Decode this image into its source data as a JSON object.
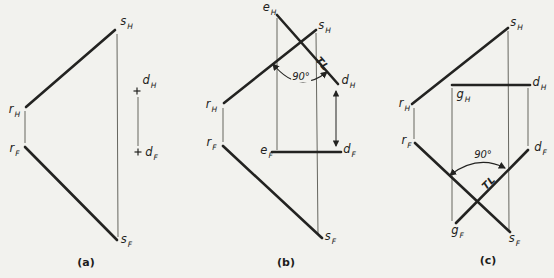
{
  "colors": {
    "paper": "#f2f2ee",
    "ink": "#232321",
    "thin": "#66665f"
  },
  "figures": {
    "a": {
      "caption": "(a)",
      "labels": {
        "sH": {
          "letter": "s",
          "sub": "H"
        },
        "rH": {
          "letter": "r",
          "sub": "H"
        },
        "rF": {
          "letter": "r",
          "sub": "F"
        },
        "sF": {
          "letter": "s",
          "sub": "F"
        },
        "dH": {
          "letter": "d",
          "sub": "H"
        },
        "dF": {
          "letter": "d",
          "sub": "F"
        }
      },
      "geometry": {
        "thick": [
          [
            26,
            107,
            115,
            30
          ],
          [
            25,
            147,
            117,
            240
          ]
        ],
        "thin": [
          [
            117,
            34,
            118,
            237
          ],
          [
            25,
            111,
            25,
            143
          ],
          [
            138,
            97,
            138,
            146
          ]
        ],
        "crosses": [
          [
            137,
            91
          ],
          [
            138,
            152
          ]
        ]
      }
    },
    "b": {
      "caption": "(b)",
      "angle": "90°",
      "tl": "TL",
      "labels": {
        "eH": {
          "letter": "e",
          "sub": "H"
        },
        "sH": {
          "letter": "s",
          "sub": "H"
        },
        "rH": {
          "letter": "r",
          "sub": "H"
        },
        "rF": {
          "letter": "r",
          "sub": "F"
        },
        "eF": {
          "letter": "e",
          "sub": "F"
        },
        "dH": {
          "letter": "d",
          "sub": "H"
        },
        "dF": {
          "letter": "d",
          "sub": "F"
        },
        "sF": {
          "letter": "s",
          "sub": "F"
        }
      },
      "geometry": {
        "thick": [
          [
            224,
            103,
            316,
            30
          ],
          [
            277,
            15,
            338,
            84
          ],
          [
            223,
            146,
            322,
            238
          ],
          [
            272,
            152,
            341,
            152
          ]
        ],
        "thin": [
          [
            277,
            18,
            277,
            150
          ],
          [
            316,
            33,
            318,
            235
          ],
          [
            223,
            108,
            223,
            142
          ]
        ],
        "doubleArrows": [
          [
            336,
            91,
            336,
            146
          ]
        ],
        "arcs": [
          {
            "d": "M273,64 Q298,95 327,72"
          }
        ]
      }
    },
    "c": {
      "caption": "(c)",
      "angle": "90°",
      "tl": "TL",
      "labels": {
        "sH": {
          "letter": "s",
          "sub": "H"
        },
        "rH": {
          "letter": "r",
          "sub": "H"
        },
        "rF": {
          "letter": "r",
          "sub": "F"
        },
        "gH": {
          "letter": "g",
          "sub": "H"
        },
        "dH": {
          "letter": "d",
          "sub": "H"
        },
        "dF": {
          "letter": "d",
          "sub": "F"
        },
        "gF": {
          "letter": "g",
          "sub": "F"
        },
        "sF": {
          "letter": "s",
          "sub": "F"
        }
      },
      "geometry": {
        "thick": [
          [
            412,
            104,
            508,
            28
          ],
          [
            452,
            85,
            530,
            85
          ],
          [
            415,
            143,
            510,
            232
          ],
          [
            456,
            223,
            528,
            150
          ]
        ],
        "thin": [
          [
            414,
            108,
            414,
            139
          ],
          [
            452,
            88,
            452,
            221
          ],
          [
            508,
            31,
            509,
            230
          ],
          [
            528,
            88,
            528,
            146
          ]
        ],
        "arcs": [
          {
            "d": "M450,175 Q478,154 505,168"
          }
        ]
      }
    }
  }
}
